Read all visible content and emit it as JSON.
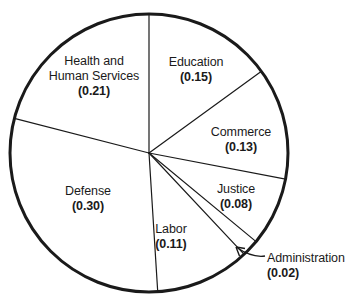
{
  "chart_data": {
    "type": "pie",
    "title": "",
    "subtitle": "",
    "xlabel": "",
    "ylabel": "",
    "legend_position": "none",
    "grid": false,
    "value_format": "(0.00)",
    "total": 1.0,
    "start_angle_deg": 0,
    "direction": "clockwise",
    "categories": [
      "Education",
      "Commerce",
      "Justice",
      "Administration",
      "Labor",
      "Defense",
      "Health and Human Services"
    ],
    "values": [
      0.15,
      0.13,
      0.08,
      0.02,
      0.11,
      0.3,
      0.21
    ],
    "slices": [
      {
        "id": "education",
        "name": "Education",
        "name_lines": [
          "Education"
        ],
        "value": 0.15,
        "value_text": "(0.15)",
        "label_placement": "inside",
        "label_x": 196,
        "label_y": 55
      },
      {
        "id": "commerce",
        "name": "Commerce",
        "name_lines": [
          "Commerce"
        ],
        "value": 0.13,
        "value_text": "(0.13)",
        "label_placement": "inside",
        "label_x": 241,
        "label_y": 125
      },
      {
        "id": "justice",
        "name": "Justice",
        "name_lines": [
          "Justice"
        ],
        "value": 0.08,
        "value_text": "(0.08)",
        "label_placement": "inside",
        "label_x": 236,
        "label_y": 182
      },
      {
        "id": "administration",
        "name": "Administration",
        "name_lines": [
          "Administration"
        ],
        "value": 0.02,
        "value_text": "(0.02)",
        "label_placement": "callout",
        "label_x": 267,
        "label_y": 251
      },
      {
        "id": "labor",
        "name": "Labor",
        "name_lines": [
          "Labor"
        ],
        "value": 0.11,
        "value_text": "(0.11)",
        "label_placement": "inside",
        "label_x": 171,
        "label_y": 222
      },
      {
        "id": "defense",
        "name": "Defense",
        "name_lines": [
          "Defense"
        ],
        "value": 0.3,
        "value_text": "(0.30)",
        "label_placement": "inside",
        "label_x": 88,
        "label_y": 184
      },
      {
        "id": "health-and-human-services",
        "name": "Health and Human Services",
        "name_lines": [
          "Health and",
          "Human Services"
        ],
        "value": 0.21,
        "value_text": "(0.21)",
        "label_placement": "inside",
        "label_x": 94,
        "label_y": 54
      }
    ],
    "geometry": {
      "center_x": 149,
      "center_y": 153,
      "radius": 139,
      "outline_color": "#1a1a1a",
      "outline_width": 3,
      "divider_color": "#1a1a1a",
      "divider_width": 1.2,
      "fill_color": "#ffffff"
    },
    "callout": {
      "target_x": 236,
      "target_y": 247,
      "elbow_x": 252,
      "elbow_y": 258,
      "text_x": 265,
      "text_y": 256
    }
  }
}
